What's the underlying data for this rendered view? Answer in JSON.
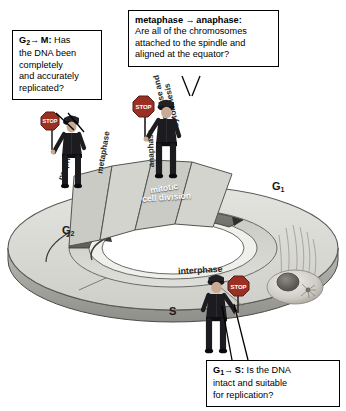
{
  "diagram": {
    "background_color": "#ffffff",
    "disc_face_color": "#d8d8d4",
    "band_color": "#6e6e6e",
    "stop_sign_color": "#9a3024"
  },
  "callouts": [
    {
      "id": "g2m",
      "prefix": "G",
      "subscript": "2",
      "arrow": "→",
      "target": "M",
      "separator": ":",
      "lines": [
        "Has",
        "the DNA been",
        "completely",
        "and accurately",
        "replicated?"
      ],
      "full_text": "G2 → M: Has the DNA been completely and accurately replicated?"
    },
    {
      "id": "metaphase-anaphase",
      "prefix": "metaphase",
      "subscript": "",
      "arrow": "→",
      "target": "anaphase",
      "separator": ":",
      "lines": [
        "Are all of the chromosomes",
        "attached to the spindle and",
        "aligned at the equator?"
      ],
      "full_text": "metaphase → anaphase: Are all of the chromosomes attached to the spindle and aligned at the equator?"
    },
    {
      "id": "g1s",
      "prefix": "G",
      "subscript": "1",
      "arrow": "→",
      "target": "S",
      "separator": ":",
      "lines": [
        "Is the DNA",
        "intact and suitable",
        "for replication?"
      ],
      "full_text": "G1 → S: Is the DNA intact and suitable for replication?"
    }
  ],
  "disc": {
    "phases": [
      {
        "name": "G1",
        "label": "G",
        "subscript": "1"
      },
      {
        "name": "S",
        "label": "S",
        "subscript": ""
      },
      {
        "name": "G2",
        "label": "G",
        "subscript": "2"
      }
    ],
    "mitotic_sectors": [
      {
        "label": "prophase"
      },
      {
        "label": "metaphase"
      },
      {
        "label": "anaphase"
      },
      {
        "label": "telophase and cytokinesis"
      }
    ],
    "band_label_line1": "mitotic",
    "band_label_line2": "cell division",
    "inner_ring_label": "interphase"
  },
  "guards": [
    {
      "id": "guard-g2m",
      "sign_text": "STOP"
    },
    {
      "id": "guard-metaphase",
      "sign_text": "STOP"
    },
    {
      "id": "guard-g1s",
      "sign_text": "STOP"
    }
  ]
}
